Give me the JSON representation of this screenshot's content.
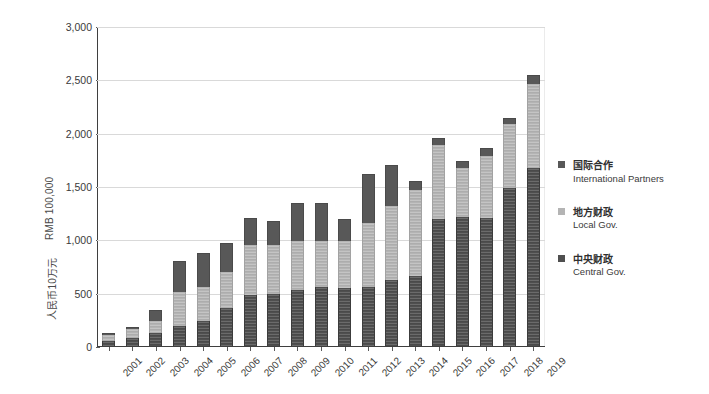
{
  "chart_data": {
    "type": "bar",
    "stacked": true,
    "title": "",
    "xlabel": "",
    "ylabel": "RMB 100,000",
    "ylabel_zh": "人民币10万元",
    "ylim": [
      0,
      3000
    ],
    "ytick_values": [
      0,
      500,
      1000,
      1500,
      2000,
      2500,
      3000
    ],
    "ytick_labels": [
      "0",
      "500",
      "1,000",
      "1,500",
      "2,000",
      "2,500",
      "3,000"
    ],
    "grid": true,
    "legend_position": "right",
    "categories": [
      "2001",
      "2002",
      "2003",
      "2004",
      "2005",
      "2006",
      "2007",
      "2008",
      "2009",
      "2010",
      "2011",
      "2012",
      "2013",
      "2014",
      "2015",
      "2016",
      "2017",
      "2018",
      "2019"
    ],
    "series": [
      {
        "name": "Central Gov.",
        "name_zh": "中央财政",
        "color": "#4f4f4f",
        "values": [
          60,
          80,
          130,
          195,
          245,
          370,
          490,
          500,
          530,
          565,
          555,
          565,
          625,
          670,
          1200,
          1215,
          1210,
          1490,
          1680
        ]
      },
      {
        "name": "Local Gov.",
        "name_zh": "地方财政",
        "color": "#b4b4b4",
        "values": [
          55,
          85,
          110,
          325,
          320,
          335,
          470,
          455,
          460,
          430,
          440,
          600,
          700,
          800,
          695,
          460,
          580,
          600,
          790
        ]
      },
      {
        "name": "International Partners",
        "name_zh": "国际合作",
        "color": "#585858",
        "values": [
          15,
          25,
          110,
          290,
          315,
          270,
          245,
          230,
          360,
          355,
          205,
          460,
          385,
          90,
          60,
          65,
          75,
          60,
          80
        ]
      }
    ],
    "totals": [
      130,
      190,
      350,
      810,
      880,
      975,
      1205,
      1185,
      1350,
      1350,
      1200,
      1625,
      1710,
      1560,
      1955,
      1740,
      1865,
      2150,
      2550
    ]
  },
  "legend": {
    "items": [
      {
        "zh": "国际合作",
        "en": "International Partners",
        "swatch": "sw-intl"
      },
      {
        "zh": "地方财政",
        "en": "Local Gov.",
        "swatch": "sw-local"
      },
      {
        "zh": "中央财政",
        "en": "Central Gov.",
        "swatch": "sw-central"
      }
    ]
  }
}
